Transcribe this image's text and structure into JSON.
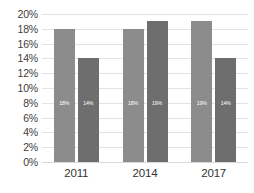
{
  "chart_data": {
    "type": "bar",
    "title": "",
    "subtitle": "",
    "xlabel": "",
    "ylabel": "",
    "categories": [
      "2011",
      "2014",
      "2017"
    ],
    "series": [
      {
        "name": "Series 1",
        "color": "#8c8c8c",
        "values": [
          18,
          18,
          19
        ],
        "labels": [
          "18%",
          "18%",
          "19%"
        ]
      },
      {
        "name": "Series 2",
        "color": "#6e6e6e",
        "values": [
          14,
          19,
          14
        ],
        "labels": [
          "14%",
          "19%",
          "14%"
        ]
      }
    ],
    "ylim": [
      0,
      20
    ],
    "ytick_step": 2,
    "ytick_labels": [
      "20%",
      "18%",
      "16%",
      "14%",
      "12%",
      "10%",
      "8%",
      "6%",
      "4%",
      "2%",
      "0%"
    ],
    "ytick_values": [
      20,
      18,
      16,
      14,
      12,
      10,
      8,
      6,
      4,
      2,
      0
    ],
    "grid": true,
    "grid_color": "#e3e3e3",
    "legend": false,
    "legend_position": "none",
    "background": "#ffffff",
    "value_labels_inside_bars": true
  }
}
